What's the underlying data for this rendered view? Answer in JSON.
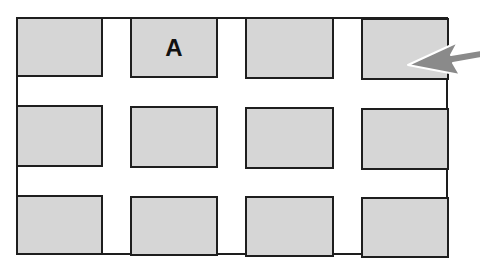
{
  "diagram": {
    "title": "",
    "grid": {
      "rows": 3,
      "columns": 4
    },
    "colors": {
      "block_fill": "#d6d6d6",
      "outline": "#1e1e1e",
      "street": "#ffffff",
      "arrow": "#8a8a8a"
    },
    "blocks": [
      {
        "row": 1,
        "col": 1,
        "label": ""
      },
      {
        "row": 1,
        "col": 2,
        "label": "A"
      },
      {
        "row": 1,
        "col": 3,
        "label": ""
      },
      {
        "row": 1,
        "col": 4,
        "label": ""
      },
      {
        "row": 2,
        "col": 1,
        "label": ""
      },
      {
        "row": 2,
        "col": 2,
        "label": ""
      },
      {
        "row": 2,
        "col": 3,
        "label": ""
      },
      {
        "row": 2,
        "col": 4,
        "label": ""
      },
      {
        "row": 3,
        "col": 1,
        "label": ""
      },
      {
        "row": 3,
        "col": 2,
        "label": ""
      },
      {
        "row": 3,
        "col": 3,
        "label": ""
      },
      {
        "row": 3,
        "col": 4,
        "label": ""
      }
    ],
    "arrow": {
      "points_to": "row 1, col 4 block",
      "direction": "left"
    }
  }
}
